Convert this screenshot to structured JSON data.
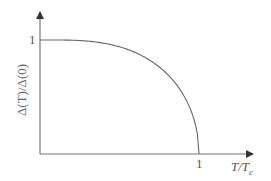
{
  "chart_data": {
    "type": "line",
    "title": "",
    "xlabel": "T/T_c",
    "ylabel": "Δ(T)/Δ(0)",
    "x_ticks": [
      "1"
    ],
    "y_ticks": [
      "1"
    ],
    "xlim": [
      0,
      1.25
    ],
    "ylim": [
      0,
      1.2
    ],
    "grid": false,
    "legend": null,
    "series": [
      {
        "name": "gap",
        "x": [
          0,
          0.2,
          0.3,
          0.4,
          0.5,
          0.6,
          0.7,
          0.8,
          0.9,
          0.95,
          1.0
        ],
        "y": [
          1.0,
          0.99,
          0.97,
          0.93,
          0.87,
          0.79,
          0.69,
          0.56,
          0.39,
          0.27,
          0.0
        ]
      }
    ]
  },
  "labels": {
    "y_tick": "1",
    "x_tick": "1",
    "x_axis": "T/T",
    "x_axis_sub": "c",
    "y_axis": "Δ(T)/Δ(0)"
  },
  "colors": {
    "axis": "#555555",
    "curve": "#666666"
  }
}
